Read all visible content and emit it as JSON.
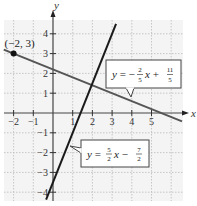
{
  "chart_data": {
    "type": "line",
    "title": "",
    "xlabel": "x",
    "ylabel": "y",
    "xlim": [
      -2.5,
      6.6
    ],
    "ylim": [
      -4.6,
      4.7
    ],
    "grid": true,
    "x_ticks": [
      -2,
      -1,
      1,
      2,
      3,
      4,
      5
    ],
    "x_tick_labels": [
      "−2",
      "−1",
      "1",
      "2",
      "3",
      "4",
      "5"
    ],
    "y_ticks": [
      4,
      3,
      2,
      1,
      -1,
      -2,
      -3,
      -4
    ],
    "y_tick_labels": [
      "4",
      "3",
      "2",
      "1",
      "−1",
      "−2",
      "−3",
      "−4"
    ],
    "series": [
      {
        "name": "shallow-line",
        "slope": -0.4,
        "intercept": 2.2,
        "x_range": [
          -2.5,
          6.55
        ],
        "label": {
          "lhs": "y = −",
          "f1_num": "2",
          "f1_den": "5",
          "mid": "x + ",
          "f2_num": "11",
          "f2_den": "5"
        },
        "color": "#555555"
      },
      {
        "name": "steep-line",
        "slope": 2.5,
        "intercept": -3.5,
        "x_range": [
          -0.35,
          3.2
        ],
        "label": {
          "lhs": "y = ",
          "f1_num": "5",
          "f1_den": "2",
          "mid": "x − ",
          "f2_num": "7",
          "f2_den": "2"
        },
        "color": "#1a1a1a"
      }
    ],
    "points": [
      {
        "x": -2,
        "y": 3,
        "label": "(−2, 3)"
      }
    ]
  }
}
